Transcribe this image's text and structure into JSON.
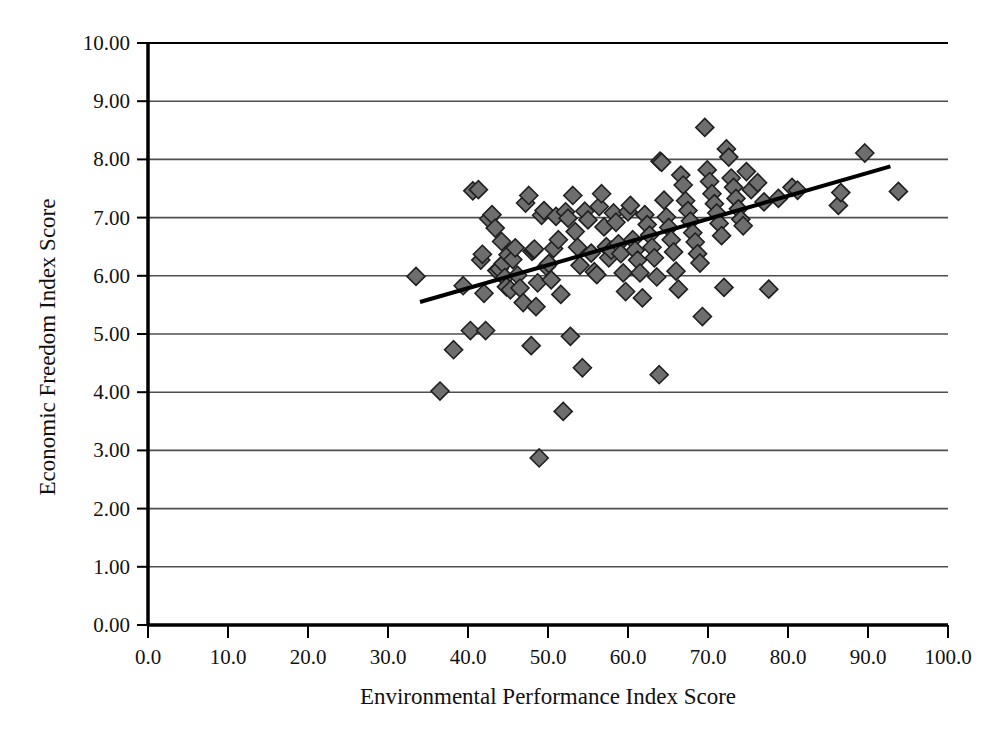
{
  "chart_data": {
    "type": "scatter",
    "title": "Figure: Environmental Performance vs Economic Freedom",
    "xlabel": "Environmental Performance Index Score",
    "ylabel": "Economic Freedom Index Score",
    "xlim": [
      0,
      100
    ],
    "ylim": [
      0,
      10
    ],
    "xticks": [
      "0.0",
      "10.0",
      "20.0",
      "30.0",
      "40.0",
      "50.0",
      "60.0",
      "70.0",
      "80.0",
      "90.0",
      "100.0"
    ],
    "xtick_values": [
      0,
      10,
      20,
      30,
      40,
      50,
      60,
      70,
      80,
      90,
      100
    ],
    "yticks": [
      "0.00",
      "1.00",
      "2.00",
      "3.00",
      "4.00",
      "5.00",
      "6.00",
      "7.00",
      "8.00",
      "9.00",
      "10.00"
    ],
    "ytick_values": [
      0,
      1,
      2,
      3,
      4,
      5,
      6,
      7,
      8,
      9,
      10
    ],
    "grid": "horizontal",
    "legend": "none",
    "marker": "diamond",
    "marker_fill": "#6e6e6e",
    "marker_edge": "#1f1f1f",
    "marker_size": 9,
    "trendline": {
      "type": "linear",
      "color": "#000000",
      "width": 4,
      "x_start": 34.0,
      "y_start": 5.55,
      "x_end": 92.8,
      "y_end": 7.88
    },
    "series": [
      {
        "name": "Countries",
        "points": [
          [
            33.5,
            5.99
          ],
          [
            36.5,
            4.02
          ],
          [
            38.2,
            4.73
          ],
          [
            39.4,
            5.83
          ],
          [
            40.3,
            5.06
          ],
          [
            40.6,
            7.46
          ],
          [
            41.3,
            7.48
          ],
          [
            41.6,
            6.27
          ],
          [
            41.8,
            6.37
          ],
          [
            42.0,
            5.7
          ],
          [
            42.2,
            5.06
          ],
          [
            42.6,
            6.98
          ],
          [
            43.0,
            7.05
          ],
          [
            43.4,
            6.82
          ],
          [
            43.6,
            6.09
          ],
          [
            43.9,
            6.12
          ],
          [
            44.2,
            6.59
          ],
          [
            44.4,
            6.21
          ],
          [
            44.6,
            5.97
          ],
          [
            44.8,
            5.81
          ],
          [
            45.0,
            6.36
          ],
          [
            45.3,
            5.76
          ],
          [
            45.6,
            6.28
          ],
          [
            45.9,
            6.48
          ],
          [
            46.2,
            6.01
          ],
          [
            46.5,
            5.79
          ],
          [
            46.9,
            5.54
          ],
          [
            47.2,
            7.25
          ],
          [
            47.6,
            7.38
          ],
          [
            47.9,
            4.8
          ],
          [
            48.0,
            6.42
          ],
          [
            48.2,
            6.44
          ],
          [
            48.3,
            6.46
          ],
          [
            48.5,
            5.47
          ],
          [
            48.7,
            5.88
          ],
          [
            48.9,
            2.87
          ],
          [
            49.2,
            7.04
          ],
          [
            49.5,
            7.12
          ],
          [
            49.8,
            6.16
          ],
          [
            50.1,
            6.21
          ],
          [
            50.4,
            5.93
          ],
          [
            50.7,
            6.47
          ],
          [
            51.0,
            7.02
          ],
          [
            51.3,
            6.62
          ],
          [
            51.6,
            5.68
          ],
          [
            51.9,
            3.67
          ],
          [
            52.2,
            7.1
          ],
          [
            52.5,
            6.99
          ],
          [
            52.8,
            4.96
          ],
          [
            53.1,
            7.38
          ],
          [
            53.4,
            6.76
          ],
          [
            53.7,
            6.49
          ],
          [
            54.0,
            6.18
          ],
          [
            54.3,
            4.42
          ],
          [
            54.6,
            7.11
          ],
          [
            55.0,
            6.96
          ],
          [
            55.4,
            6.39
          ],
          [
            55.8,
            6.07
          ],
          [
            56.1,
            6.02
          ],
          [
            56.4,
            7.19
          ],
          [
            56.7,
            7.41
          ],
          [
            57.0,
            6.84
          ],
          [
            57.3,
            6.5
          ],
          [
            57.6,
            6.31
          ],
          [
            57.9,
            6.44
          ],
          [
            58.2,
            7.08
          ],
          [
            58.5,
            6.92
          ],
          [
            58.8,
            6.55
          ],
          [
            59.1,
            6.38
          ],
          [
            59.4,
            6.05
          ],
          [
            59.7,
            5.73
          ],
          [
            60.0,
            7.1
          ],
          [
            60.3,
            7.21
          ],
          [
            60.6,
            6.62
          ],
          [
            60.9,
            6.44
          ],
          [
            61.2,
            6.27
          ],
          [
            61.5,
            6.05
          ],
          [
            61.8,
            5.62
          ],
          [
            62.1,
            7.05
          ],
          [
            62.4,
            6.88
          ],
          [
            62.7,
            6.7
          ],
          [
            63.0,
            6.49
          ],
          [
            63.3,
            6.31
          ],
          [
            63.6,
            5.98
          ],
          [
            63.9,
            4.3
          ],
          [
            64.0,
            7.97
          ],
          [
            64.2,
            7.95
          ],
          [
            64.5,
            7.3
          ],
          [
            64.8,
            7.01
          ],
          [
            65.1,
            6.83
          ],
          [
            65.4,
            6.62
          ],
          [
            65.7,
            6.41
          ],
          [
            66.0,
            6.08
          ],
          [
            66.3,
            5.77
          ],
          [
            66.6,
            7.73
          ],
          [
            66.9,
            7.56
          ],
          [
            67.2,
            7.29
          ],
          [
            67.5,
            7.12
          ],
          [
            67.8,
            6.94
          ],
          [
            68.1,
            6.74
          ],
          [
            68.4,
            6.58
          ],
          [
            68.7,
            6.38
          ],
          [
            69.0,
            6.22
          ],
          [
            69.3,
            5.3
          ],
          [
            69.6,
            8.55
          ],
          [
            69.9,
            7.82
          ],
          [
            70.2,
            7.62
          ],
          [
            70.5,
            7.41
          ],
          [
            70.8,
            7.24
          ],
          [
            71.1,
            7.08
          ],
          [
            71.4,
            6.9
          ],
          [
            71.7,
            6.69
          ],
          [
            72.0,
            5.8
          ],
          [
            72.3,
            8.18
          ],
          [
            72.6,
            8.04
          ],
          [
            72.9,
            7.68
          ],
          [
            73.2,
            7.52
          ],
          [
            73.5,
            7.33
          ],
          [
            73.8,
            7.15
          ],
          [
            74.1,
            6.97
          ],
          [
            74.4,
            6.86
          ],
          [
            74.8,
            7.79
          ],
          [
            75.4,
            7.48
          ],
          [
            76.2,
            7.6
          ],
          [
            77.0,
            7.27
          ],
          [
            77.6,
            5.77
          ],
          [
            78.8,
            7.33
          ],
          [
            80.5,
            7.52
          ],
          [
            81.2,
            7.47
          ],
          [
            86.3,
            7.21
          ],
          [
            86.6,
            7.43
          ],
          [
            89.6,
            8.11
          ],
          [
            93.8,
            7.45
          ]
        ]
      }
    ]
  },
  "axes": {
    "x_title": "Environmental Performance Index Score",
    "y_title": "Economic Freedom Index Score"
  }
}
